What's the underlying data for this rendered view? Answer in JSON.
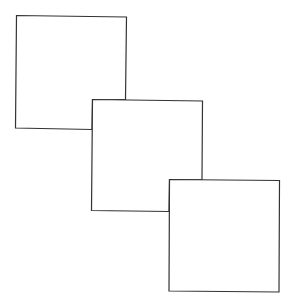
{
  "diagram": {
    "stroke_color": "#333333",
    "fill_color": "#ffffff",
    "squares": [
      {
        "id": "square-1",
        "points": "16.5,15.5 126.5,17 125.5,99.5 92.5,99.5 92,129.5 15.5,128"
      },
      {
        "id": "square-2",
        "points": "92.5,99.5 202.5,101 202,179.5 169.5,179.5 169,211.5 91.5,210.5"
      },
      {
        "id": "square-3",
        "points": "169.5,179.5 279.5,180.5 279,292 169,291"
      }
    ]
  },
  "caption": {
    "text": ""
  }
}
